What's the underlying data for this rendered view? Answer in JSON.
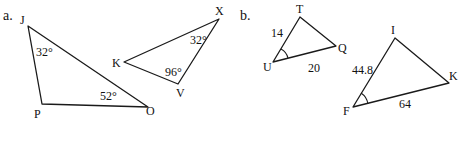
{
  "parts": [
    {
      "label": "a.",
      "triangles": [
        {
          "vertices": {
            "J": "J",
            "P": "P",
            "O": "O"
          },
          "angles": {
            "J": "32°",
            "O": "52°"
          }
        },
        {
          "vertices": {
            "X": "X",
            "K": "K",
            "V": "V"
          },
          "angles": {
            "X": "32°",
            "V": "96°"
          }
        }
      ]
    },
    {
      "label": "b.",
      "triangles": [
        {
          "vertices": {
            "T": "T",
            "U": "U",
            "Q": "Q"
          },
          "sides": {
            "UT": "14",
            "UQ": "20"
          },
          "marked_angle": "U"
        },
        {
          "vertices": {
            "I": "I",
            "F": "F",
            "K": "K"
          },
          "sides": {
            "FI": "44.8",
            "FK": "64"
          },
          "marked_angle": "F"
        }
      ]
    }
  ]
}
